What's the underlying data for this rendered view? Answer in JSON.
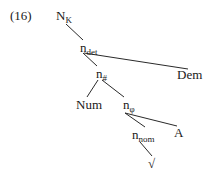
{
  "example_number": "(16)",
  "tree": {
    "nodes": [
      {
        "id": "NK",
        "base": "N",
        "sub": "K",
        "x": 56,
        "y": 9
      },
      {
        "id": "ndet",
        "base": "n",
        "sub": "det",
        "x": 80,
        "y": 41
      },
      {
        "id": "nnum",
        "base": "n",
        "sub": "#",
        "x": 96,
        "y": 67
      },
      {
        "id": "Dem",
        "base": "Dem",
        "sub": "",
        "x": 177,
        "y": 68
      },
      {
        "id": "Num",
        "base": "Num",
        "sub": "",
        "x": 76,
        "y": 98
      },
      {
        "id": "nphi",
        "base": "n",
        "sub": "φ",
        "x": 123,
        "y": 98
      },
      {
        "id": "nnom",
        "base": "n",
        "sub": "nom",
        "x": 132,
        "y": 128
      },
      {
        "id": "A",
        "base": "A",
        "sub": "",
        "x": 174,
        "y": 126
      },
      {
        "id": "root",
        "base": "√",
        "sub": "",
        "x": 148,
        "y": 157
      }
    ],
    "edges": [
      {
        "from": "NK",
        "to": "ndet",
        "x1": 66,
        "y1": 24,
        "x2": 83,
        "y2": 40
      },
      {
        "from": "ndet",
        "to": "nnum",
        "x1": 83,
        "y1": 53,
        "x2": 97,
        "y2": 66
      },
      {
        "from": "ndet",
        "to": "Dem",
        "x1": 84,
        "y1": 53,
        "x2": 188,
        "y2": 69
      },
      {
        "from": "nnum",
        "to": "Num",
        "x1": 98,
        "y1": 80,
        "x2": 87,
        "y2": 97
      },
      {
        "from": "nnum",
        "to": "nphi",
        "x1": 102,
        "y1": 80,
        "x2": 124,
        "y2": 97
      },
      {
        "from": "nphi",
        "to": "nnom",
        "x1": 125,
        "y1": 113,
        "x2": 145,
        "y2": 127
      },
      {
        "from": "nphi",
        "to": "A",
        "x1": 125,
        "y1": 113,
        "x2": 177,
        "y2": 126
      },
      {
        "from": "nnom",
        "to": "root",
        "x1": 140,
        "y1": 142,
        "x2": 152,
        "y2": 156
      }
    ]
  }
}
